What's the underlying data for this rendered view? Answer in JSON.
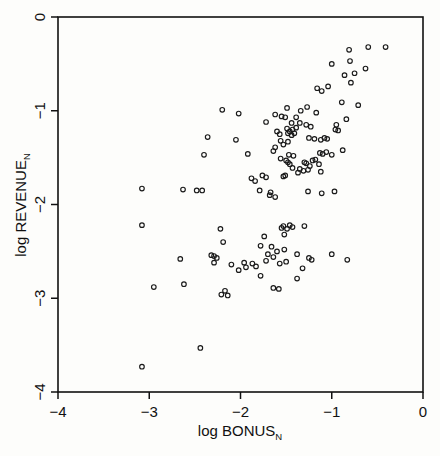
{
  "chart_data": {
    "type": "scatter",
    "title": "",
    "xlabel": "log BONUS",
    "xlabel_sub": "N",
    "ylabel": "log REVENUE",
    "ylabel_sub": "N",
    "xlim": [
      -4,
      0
    ],
    "ylim": [
      -4,
      0
    ],
    "xticks": [
      -4,
      -3,
      -2,
      -1,
      0
    ],
    "yticks": [
      -4,
      -3,
      -2,
      -1,
      0
    ],
    "xtick_labels": [
      "−4",
      "−3",
      "−2",
      "−1",
      "0"
    ],
    "ytick_labels": [
      "−4",
      "−3",
      "−2",
      "−1",
      "0"
    ],
    "grid": false,
    "legend": false,
    "marker": "open-circle",
    "marker_size_px": 4.6,
    "marker_color": "#1a1a1a",
    "n_points": 143,
    "points": [
      [
        -0.6,
        -0.32
      ],
      [
        -0.41,
        -0.32
      ],
      [
        -0.81,
        -0.35
      ],
      [
        -1.0,
        -0.5
      ],
      [
        -0.8,
        -0.47
      ],
      [
        -0.63,
        -0.55
      ],
      [
        -0.86,
        -0.62
      ],
      [
        -0.75,
        -0.6
      ],
      [
        -0.79,
        -0.7
      ],
      [
        -1.16,
        -0.76
      ],
      [
        -1.11,
        -0.79
      ],
      [
        -1.04,
        -0.74
      ],
      [
        -2.2,
        -0.99
      ],
      [
        -1.49,
        -0.97
      ],
      [
        -1.27,
        -0.96
      ],
      [
        -1.17,
        -1.02
      ],
      [
        -0.89,
        -0.91
      ],
      [
        -0.71,
        -0.94
      ],
      [
        -2.02,
        -1.03
      ],
      [
        -1.62,
        -1.04
      ],
      [
        -1.51,
        -1.07
      ],
      [
        -1.39,
        -1.07
      ],
      [
        -1.72,
        -1.12
      ],
      [
        -0.84,
        -1.09
      ],
      [
        -1.28,
        -1.15
      ],
      [
        -1.23,
        -1.17
      ],
      [
        -1.49,
        -1.19
      ],
      [
        -1.43,
        -1.2
      ],
      [
        -1.39,
        -1.18
      ],
      [
        -0.95,
        -1.15
      ],
      [
        -0.96,
        -1.2
      ],
      [
        -1.48,
        -1.24
      ],
      [
        -1.44,
        -1.26
      ],
      [
        -2.36,
        -1.28
      ],
      [
        -2.05,
        -1.31
      ],
      [
        -1.25,
        -1.29
      ],
      [
        -1.19,
        -1.3
      ],
      [
        -1.12,
        -1.31
      ],
      [
        -1.48,
        -1.33
      ],
      [
        -1.62,
        -1.39
      ],
      [
        -0.88,
        -1.42
      ],
      [
        -2.4,
        -1.47
      ],
      [
        -1.92,
        -1.46
      ],
      [
        -1.47,
        -1.47
      ],
      [
        -1.42,
        -1.48
      ],
      [
        -1.13,
        -1.45
      ],
      [
        -1.1,
        -1.46
      ],
      [
        -1.0,
        -1.47
      ],
      [
        -1.48,
        -1.55
      ],
      [
        -1.46,
        -1.57
      ],
      [
        -1.28,
        -1.56
      ],
      [
        -1.24,
        -1.59
      ],
      [
        -1.14,
        -1.57
      ],
      [
        -1.43,
        -1.61
      ],
      [
        -1.35,
        -1.62
      ],
      [
        -1.12,
        -1.65
      ],
      [
        -1.88,
        -1.72
      ],
      [
        -1.84,
        -1.75
      ],
      [
        -1.72,
        -1.71
      ],
      [
        -1.51,
        -1.69
      ],
      [
        -1.79,
        -1.85
      ],
      [
        -1.67,
        -1.87
      ],
      [
        -1.62,
        -1.92
      ],
      [
        -1.26,
        -1.86
      ],
      [
        -1.11,
        -1.88
      ],
      [
        -0.97,
        -1.86
      ],
      [
        -3.08,
        -1.83
      ],
      [
        -2.63,
        -1.84
      ],
      [
        -2.48,
        -1.85
      ],
      [
        -2.42,
        -1.85
      ],
      [
        -3.08,
        -2.22
      ],
      [
        -2.22,
        -2.26
      ],
      [
        -1.53,
        -2.23
      ],
      [
        -1.46,
        -2.22
      ],
      [
        -1.43,
        -2.24
      ],
      [
        -1.3,
        -2.23
      ],
      [
        -1.52,
        -2.32
      ],
      [
        -1.74,
        -2.34
      ],
      [
        -2.19,
        -2.4
      ],
      [
        -1.78,
        -2.44
      ],
      [
        -1.66,
        -2.45
      ],
      [
        -2.32,
        -2.54
      ],
      [
        -2.29,
        -2.55
      ],
      [
        -1.38,
        -2.53
      ],
      [
        -1.0,
        -2.53
      ],
      [
        -2.66,
        -2.58
      ],
      [
        -0.83,
        -2.59
      ],
      [
        -1.72,
        -2.6
      ],
      [
        -2.1,
        -2.64
      ],
      [
        -1.94,
        -2.67
      ],
      [
        -1.83,
        -2.66
      ],
      [
        -2.02,
        -2.7
      ],
      [
        -1.32,
        -2.68
      ],
      [
        -1.38,
        -2.79
      ],
      [
        -1.78,
        -2.76
      ],
      [
        -2.62,
        -2.85
      ],
      [
        -2.95,
        -2.88
      ],
      [
        -2.17,
        -2.92
      ],
      [
        -1.64,
        -2.89
      ],
      [
        -2.21,
        -2.96
      ],
      [
        -2.44,
        -3.53
      ],
      [
        -3.08,
        -3.73
      ],
      [
        -1.55,
        -1.06
      ],
      [
        -1.46,
        -1.22
      ],
      [
        -1.41,
        -1.24
      ],
      [
        -1.76,
        -1.69
      ],
      [
        -1.53,
        -1.7
      ],
      [
        -1.37,
        -1.66
      ],
      [
        -1.31,
        -1.64
      ],
      [
        -1.6,
        -1.22
      ],
      [
        -1.57,
        -1.25
      ],
      [
        -1.64,
        -1.43
      ],
      [
        -1.53,
        -1.36
      ],
      [
        -1.56,
        -1.51
      ],
      [
        -1.5,
        -1.53
      ],
      [
        -1.21,
        -1.53
      ],
      [
        -1.18,
        -1.52
      ],
      [
        -1.44,
        -1.13
      ],
      [
        -1.35,
        -1.13
      ],
      [
        -1.08,
        -1.29
      ],
      [
        -1.05,
        -1.3
      ],
      [
        -1.3,
        -1.55
      ],
      [
        -1.26,
        -1.63
      ],
      [
        -1.49,
        -2.26
      ],
      [
        -1.55,
        -2.25
      ],
      [
        -1.6,
        -2.5
      ],
      [
        -1.52,
        -2.48
      ],
      [
        -1.7,
        -2.53
      ],
      [
        -1.64,
        -2.56
      ],
      [
        -1.57,
        -2.63
      ],
      [
        -1.5,
        -2.61
      ],
      [
        -2.29,
        -2.62
      ],
      [
        -2.26,
        -2.57
      ],
      [
        -1.96,
        -2.62
      ],
      [
        -1.87,
        -2.63
      ],
      [
        -1.25,
        -2.57
      ],
      [
        -1.22,
        -2.59
      ],
      [
        -1.58,
        -2.9
      ],
      [
        -2.14,
        -2.97
      ],
      [
        -1.34,
        -1.0
      ],
      [
        -1.56,
        -1.32
      ],
      [
        -0.93,
        -1.21
      ],
      [
        -1.06,
        -1.44
      ],
      [
        -1.68,
        -1.9
      ]
    ]
  },
  "axes_geometry": {
    "left_px": 58,
    "right_px": 423,
    "top_px": 17,
    "bottom_px": 392
  }
}
